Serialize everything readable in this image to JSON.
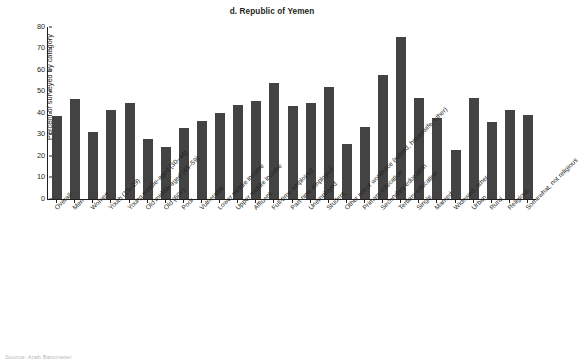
{
  "chart_data": {
    "type": "bar",
    "title": "d. Republic of Yemen",
    "xlabel": "",
    "ylabel": "Percent of surveyed by category",
    "ylim": [
      0,
      80
    ],
    "yticks": [
      0,
      10,
      20,
      30,
      40,
      50,
      60,
      70,
      80
    ],
    "grid": false,
    "legend": null,
    "bar_color": "#434343",
    "categories": [
      "Overall",
      "Men",
      "Women",
      "Youth (15–29)",
      "Young middle-aged (30–44)",
      "Old middle-aged (45–59)",
      "Old (60+)",
      "Poor",
      "Vulnerable",
      "Lower middle income",
      "Upper middle income",
      "Affluent",
      "Full-time employed",
      "Part-time employed",
      "Unemployed",
      "Student",
      "Other not of workforce (retired, housewife, other)",
      "Primary education",
      "Secondary education",
      "Tertiary education",
      "Single",
      "Married",
      "Widowed, other",
      "Urban",
      "Rural",
      "Religious",
      "Somewhat, not religious"
    ],
    "values": [
      38.7,
      46.5,
      31.0,
      41.5,
      44.7,
      28.0,
      24.0,
      33.2,
      36.2,
      40.2,
      43.8,
      45.5,
      53.8,
      43.4,
      44.8,
      52.3,
      25.5,
      33.4,
      57.8,
      75.5,
      47.0,
      37.8,
      23.0,
      46.8,
      36.0,
      41.5,
      39.2
    ]
  },
  "source": {
    "text": "Source: Arab Barometer."
  }
}
